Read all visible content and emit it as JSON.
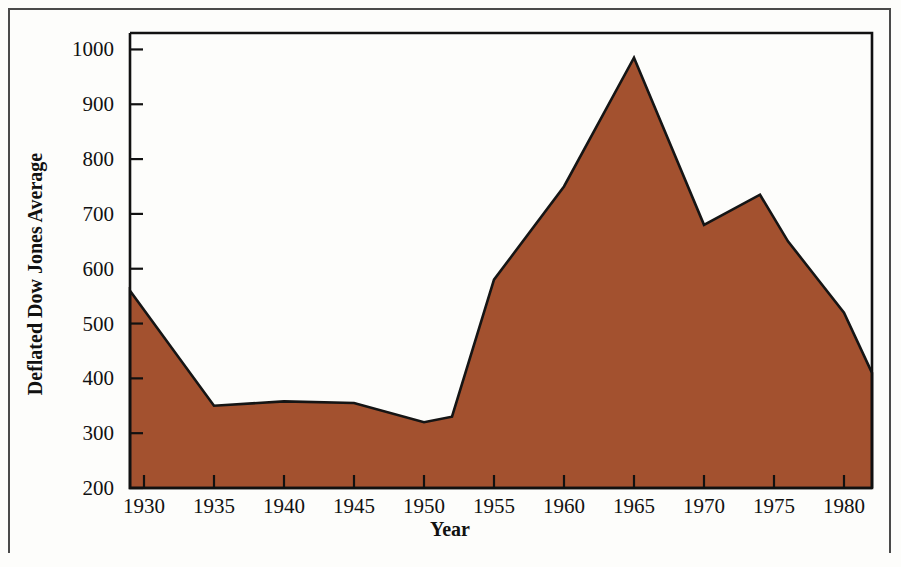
{
  "figure": {
    "background_color": "#fdfdfb",
    "frame_color": "#4a4a4a",
    "axis_color": "#111111"
  },
  "chart_data": {
    "type": "area",
    "title": "",
    "subtitle": "",
    "xlabel": "Year",
    "ylabel": "Deflated Dow Jones Average",
    "xlim": [
      1929,
      1982
    ],
    "ylim": [
      200,
      1030
    ],
    "xticks": [
      1930,
      1935,
      1940,
      1945,
      1950,
      1955,
      1960,
      1965,
      1970,
      1975,
      1980
    ],
    "xtick_labels": [
      "1930",
      "1935",
      "1940",
      "1945",
      "1950",
      "1955",
      "1960",
      "1965",
      "1970",
      "1975",
      "1980"
    ],
    "yticks": [
      200,
      300,
      400,
      500,
      600,
      700,
      800,
      900,
      1000
    ],
    "ytick_labels": [
      "200",
      "300",
      "400",
      "500",
      "600",
      "700",
      "800",
      "900",
      "1000"
    ],
    "grid": false,
    "legend": false,
    "legend_position": "none",
    "fill_color": "#a3512f",
    "line_color": "#151515",
    "baseline": 200,
    "series": [
      {
        "name": "Deflated Dow Jones Average",
        "x": [
          1929,
          1935,
          1940,
          1945,
          1950,
          1952,
          1955,
          1960,
          1965,
          1970,
          1974,
          1976,
          1978,
          1980,
          1982
        ],
        "values": [
          560,
          350,
          358,
          355,
          320,
          330,
          580,
          750,
          985,
          680,
          735,
          650,
          585,
          520,
          410
        ]
      }
    ]
  }
}
